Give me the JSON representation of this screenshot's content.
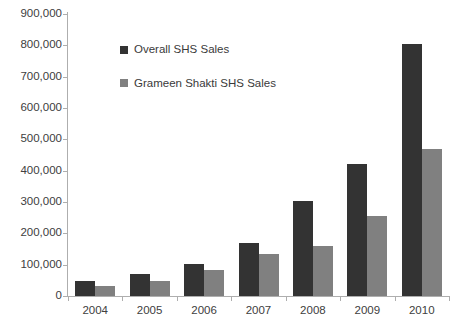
{
  "chart_data": {
    "type": "bar",
    "title": "",
    "subtitle": "",
    "xlabel": "",
    "ylabel": "",
    "categories": [
      "2004",
      "2005",
      "2006",
      "2007",
      "2008",
      "2009",
      "2010"
    ],
    "series": [
      {
        "name": "Overall SHS Sales",
        "color": "#333333",
        "values": [
          48000,
          70000,
          103000,
          168000,
          302000,
          420000,
          805000
        ]
      },
      {
        "name": "Grameen Shakti SHS Sales",
        "color": "#808080",
        "values": [
          33000,
          48000,
          82000,
          133000,
          160000,
          255000,
          470000
        ]
      }
    ],
    "ylim": [
      0,
      900000
    ],
    "ytick_values": [
      0,
      100000,
      200000,
      300000,
      400000,
      500000,
      600000,
      700000,
      800000,
      900000
    ],
    "ytick_labels": [
      "0",
      "100,000",
      "200,000",
      "300,000",
      "400,000",
      "500,000",
      "600,000",
      "700,000",
      "800,000",
      "900,000"
    ],
    "grid": false,
    "legend_position": "upper-left-inside"
  },
  "legend": {
    "items": [
      {
        "label": "Overall SHS Sales",
        "swatch": "dark-square-marker"
      },
      {
        "label": "Grameen Shakti SHS Sales",
        "swatch": "gray-square-marker"
      }
    ]
  },
  "colors": {
    "series_overall": "#333333",
    "series_grameen": "#808080",
    "axis": "#aeaeae",
    "text": "#3a3a3a",
    "background": "#ffffff"
  }
}
